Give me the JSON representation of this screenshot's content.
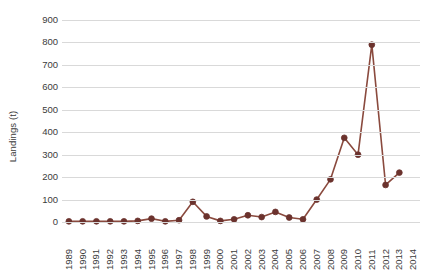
{
  "chart_data": {
    "type": "line",
    "title": "",
    "xlabel": "",
    "ylabel": "Landings (t)",
    "ylim": [
      0,
      900
    ],
    "ytick_step": 100,
    "yticks": [
      0,
      100,
      200,
      300,
      400,
      500,
      600,
      700,
      800,
      900
    ],
    "ytick_labels": [
      "0",
      "100",
      "200",
      "300",
      "400",
      "500",
      "600",
      "700",
      "800",
      "900"
    ],
    "grid": true,
    "legend": "none",
    "xticks": [
      1989,
      1990,
      1991,
      1992,
      1993,
      1994,
      1995,
      1996,
      1997,
      1998,
      1999,
      2000,
      2001,
      2002,
      2003,
      2004,
      2005,
      2006,
      2007,
      2008,
      2009,
      2010,
      2011,
      2012,
      2013,
      2014
    ],
    "xtick_labels": [
      "1989",
      "1990",
      "1991",
      "1992",
      "1993",
      "1994",
      "1995",
      "1996",
      "1997",
      "1998",
      "1999",
      "2000",
      "2001",
      "2002",
      "2003",
      "2004",
      "2005",
      "2006",
      "2007",
      "2008",
      "2009",
      "2010",
      "2011",
      "2012",
      "2013",
      "2014"
    ],
    "x": [
      1989,
      1990,
      1991,
      1992,
      1993,
      1994,
      1995,
      1996,
      1997,
      1998,
      1999,
      2000,
      2001,
      2002,
      2003,
      2004,
      2005,
      2006,
      2007,
      2008,
      2009,
      2010,
      2011,
      2012,
      2013
    ],
    "values": [
      3,
      3,
      3,
      3,
      3,
      5,
      15,
      3,
      8,
      90,
      25,
      5,
      12,
      30,
      22,
      45,
      20,
      12,
      100,
      190,
      375,
      300,
      790,
      165,
      220
    ],
    "series": [
      {
        "name": "Landings",
        "color": "#7d3c36",
        "values": [
          3,
          3,
          3,
          3,
          3,
          5,
          15,
          3,
          8,
          90,
          25,
          5,
          12,
          30,
          22,
          45,
          20,
          12,
          100,
          190,
          375,
          300,
          790,
          165,
          220
        ]
      }
    ],
    "line_color": "#8a4a3e",
    "marker_color": "#6b322d",
    "grid_color": "#d9d9d9",
    "axis_text_color": "#3b3b3b"
  }
}
